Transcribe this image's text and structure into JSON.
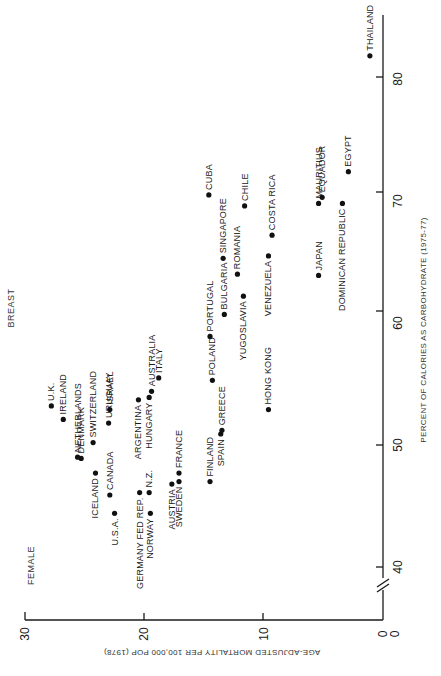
{
  "chart_data": {
    "type": "scatter",
    "title": "BREAST",
    "subtitle": "FEMALE",
    "xlabel": "PERCENT OF CALORIES AS CARBOHYDRATE (1975-77)",
    "ylabel": "AGE-ADJUSTED MORTALITY PER 100,000 POP (1978)",
    "orientation": "rotated 90° counter-clockwise on page (x-axis runs vertically along the right, y-axis runs horizontally along the bottom)",
    "x_ticks": [
      0,
      40,
      50,
      60,
      70,
      80
    ],
    "y_ticks": [
      0,
      10,
      20,
      30
    ],
    "x_tick_labels": [
      "0",
      "40",
      "50",
      "60",
      "70",
      "80"
    ],
    "y_tick_labels": [
      "0",
      "10",
      "20",
      "30"
    ],
    "xlim": [
      0,
      85
    ],
    "ylim": [
      0,
      30
    ],
    "axis_break": "x-axis broken between 0 and 40",
    "grid": false,
    "points": [
      {
        "label": "U.K.",
        "x": 53.2,
        "y": 27.8
      },
      {
        "label": "IRELAND",
        "x": 52.1,
        "y": 26.8
      },
      {
        "label": "NETHERLANDS",
        "x": 49.0,
        "y": 25.6
      },
      {
        "label": "DENMARK",
        "x": 48.9,
        "y": 25.3
      },
      {
        "label": "SWITZERLAND",
        "x": 50.2,
        "y": 24.3
      },
      {
        "label": "ICELAND",
        "x": 47.7,
        "y": 24.1
      },
      {
        "label": "URUGUAY",
        "x": 51.8,
        "y": 23.0
      },
      {
        "label": "ISRAEL",
        "x": 52.9,
        "y": 22.9
      },
      {
        "label": "CANADA",
        "x": 45.9,
        "y": 22.9
      },
      {
        "label": "U.S.A.",
        "x": 44.4,
        "y": 22.5
      },
      {
        "label": "ARGENTINA",
        "x": 53.7,
        "y": 20.5
      },
      {
        "label": "GERMANY FED REP.",
        "x": 46.1,
        "y": 20.4
      },
      {
        "label": "HUNGARY",
        "x": 53.9,
        "y": 19.6
      },
      {
        "label": "N.Z.",
        "x": 46.1,
        "y": 19.6
      },
      {
        "label": "NORWAY",
        "x": 44.4,
        "y": 19.5
      },
      {
        "label": "AUSTRALIA",
        "x": 54.4,
        "y": 19.4
      },
      {
        "label": "ITALY",
        "x": 55.5,
        "y": 18.8
      },
      {
        "label": "AUSTRIA",
        "x": 46.8,
        "y": 17.7
      },
      {
        "label": "SWEDEN",
        "x": 47.0,
        "y": 17.1
      },
      {
        "label": "FRANCE",
        "x": 47.7,
        "y": 17.1
      },
      {
        "label": "CUBA",
        "x": 70.5,
        "y": 14.6
      },
      {
        "label": "PORTUGAL",
        "x": 58.9,
        "y": 14.5
      },
      {
        "label": "FINLAND",
        "x": 47.0,
        "y": 14.5
      },
      {
        "label": "POLAND",
        "x": 55.3,
        "y": 14.3
      },
      {
        "label": "SPAIN",
        "x": 50.9,
        "y": 13.6
      },
      {
        "label": "GREECE",
        "x": 51.2,
        "y": 13.5
      },
      {
        "label": "SINGAPORE",
        "x": 65.3,
        "y": 13.4
      },
      {
        "label": "BULGARIA",
        "x": 60.7,
        "y": 13.3
      },
      {
        "label": "ROMANIA",
        "x": 64.0,
        "y": 12.2
      },
      {
        "label": "YUGOSLAVIA",
        "x": 62.2,
        "y": 11.7
      },
      {
        "label": "CHILE",
        "x": 69.6,
        "y": 11.6
      },
      {
        "label": "HONG KONG",
        "x": 52.9,
        "y": 9.6
      },
      {
        "label": "VENEZUELA",
        "x": 65.5,
        "y": 9.6
      },
      {
        "label": "COSTA RICA",
        "x": 67.2,
        "y": 9.3
      },
      {
        "label": "JAPAN",
        "x": 63.9,
        "y": 5.4
      },
      {
        "label": "MAURITIUS",
        "x": 69.8,
        "y": 5.4
      },
      {
        "label": "EQUADOR",
        "x": 70.3,
        "y": 5.1
      },
      {
        "label": "DOMINICAN REPUBLIC",
        "x": 69.8,
        "y": 3.4
      },
      {
        "label": "EGYPT",
        "x": 72.4,
        "y": 2.9
      },
      {
        "label": "THAILAND",
        "x": 81.9,
        "y": 1.1
      }
    ]
  },
  "labels": {
    "title": "BREAST",
    "subtitle": "FEMALE",
    "xlabel": "PERCENT OF CALORIES AS CARBOHYDRATE (1975-77)",
    "ylabel": "AGE-ADJUSTED MORTALITY PER 100,000 POP (1978)"
  }
}
